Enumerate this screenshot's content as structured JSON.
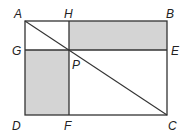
{
  "diagram": {
    "points": {
      "A": {
        "label": "A",
        "x": 25,
        "y": 21
      },
      "H": {
        "label": "H",
        "x": 69,
        "y": 21
      },
      "B": {
        "label": "B",
        "x": 167,
        "y": 21
      },
      "G": {
        "label": "G",
        "x": 25,
        "y": 50
      },
      "P": {
        "label": "P",
        "x": 69,
        "y": 50
      },
      "E": {
        "label": "E",
        "x": 167,
        "y": 50
      },
      "D": {
        "label": "D",
        "x": 25,
        "y": 115
      },
      "F": {
        "label": "F",
        "x": 69,
        "y": 115
      },
      "C": {
        "label": "C",
        "x": 167,
        "y": 115
      }
    },
    "shaded_regions": [
      "HBEP",
      "GPFD"
    ],
    "colors": {
      "line": "#333333",
      "shade": "#d4d4d4"
    }
  }
}
